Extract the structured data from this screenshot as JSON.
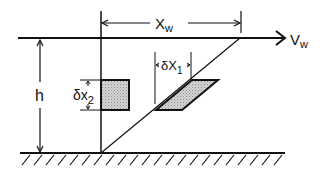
{
  "diagram": {
    "labels": {
      "horizontal_distance": "X",
      "horizontal_distance_sub": "w",
      "velocity": "V",
      "velocity_sub": "w",
      "height": "h",
      "delta_x1": "δX",
      "delta_x1_sub": "1",
      "delta_x2": "δx",
      "delta_x2_sub": "2"
    },
    "colors": {
      "stroke": "#111111",
      "fill_stipple": "#c8c8c8",
      "background": "#ffffff"
    }
  }
}
